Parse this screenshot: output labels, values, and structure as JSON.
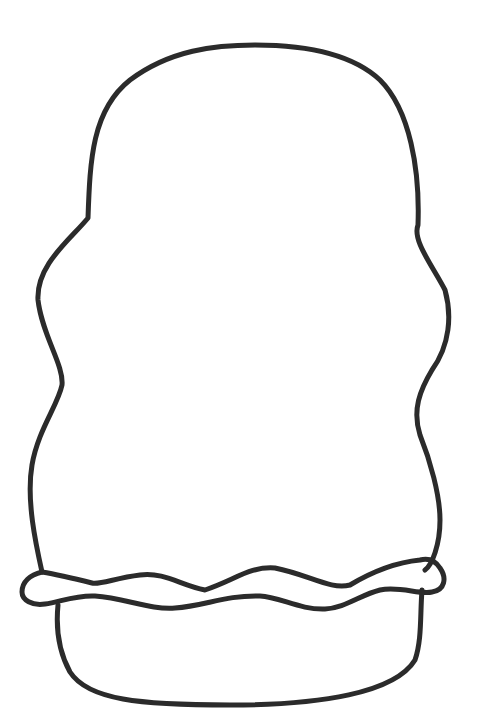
{
  "drawing": {
    "title": "Cupcake outline coloring page",
    "subject": "outline of a rounded frosting top over a wavy band and a cup base",
    "colors": {
      "background": "#ffffff",
      "line": "#2b2b2b"
    },
    "line_width": 5,
    "paths": {
      "frosting": "M42,572 C36,545 26,500 32,465 C38,430 58,405 62,385 C64,365 42,335 38,300 C36,265 70,240 88,218 C90,160 92,110 130,80 C170,50 215,45 255,45 C300,45 350,52 380,80 C410,110 420,170 418,225 C412,240 432,265 445,290 C452,315 450,345 432,370 C420,390 412,410 420,435 C430,460 440,495 440,520 C440,545 432,565 425,570",
      "band_top": "M42,572 C30,575 22,582 22,592 C22,600 32,606 45,604 C60,602 75,595 95,596 C125,598 150,610 175,608 C205,606 225,595 260,596 C280,597 300,610 325,609 C345,608 360,595 380,590 C400,586 420,595 432,592 C445,590 447,578 440,568 C435,560 428,558 420,560 C400,562 375,570 350,585 C330,590 310,575 275,568 C250,566 235,580 205,590 C180,585 165,572 140,575 C115,578 100,585 92,583 C80,580 60,575 42,572",
      "cup_base": "M58,605 C56,625 58,650 70,672 C88,700 140,705 230,705 C320,705 395,693 415,660 C422,640 420,615 422,590"
    }
  }
}
